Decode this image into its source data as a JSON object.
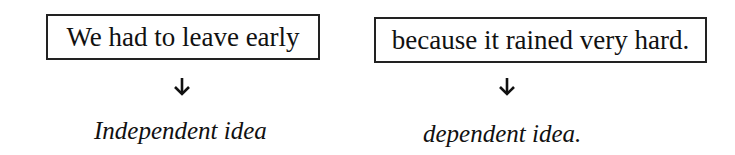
{
  "diagram": {
    "clauses": [
      {
        "text": "We had to leave early",
        "label": "Independent idea"
      },
      {
        "text": "because it rained very hard.",
        "label": "dependent idea."
      }
    ],
    "arrow_icon": "down-arrow-icon"
  }
}
